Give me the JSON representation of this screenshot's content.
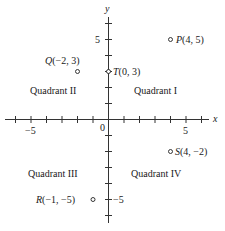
{
  "diagram": {
    "axes": {
      "x_label": "x",
      "y_label": "y",
      "origin_label": "0",
      "x_tick_labels": [
        "−5",
        "5"
      ],
      "y_tick_labels": [
        "5",
        "−5"
      ],
      "x_range": [
        -6.5,
        6.5
      ],
      "y_range": [
        -6.5,
        6.5
      ]
    },
    "quadrants": [
      {
        "label": "Quadrant I"
      },
      {
        "label": "Quadrant II"
      },
      {
        "label": "Quadrant III"
      },
      {
        "label": "Quadrant IV"
      }
    ],
    "points": [
      {
        "name": "P",
        "x": 4,
        "y": 5,
        "label_name": "P",
        "label_coords": "(4, 5)"
      },
      {
        "name": "Q",
        "x": -2,
        "y": 3,
        "label_name": "Q",
        "label_coords": "(−2, 3)"
      },
      {
        "name": "T",
        "x": 0,
        "y": 3,
        "label_name": "T",
        "label_coords": "(0, 3)"
      },
      {
        "name": "S",
        "x": 4,
        "y": -2,
        "label_name": "S",
        "label_coords": "(4, −2)"
      },
      {
        "name": "R",
        "x": -1,
        "y": -5,
        "label_name": "R",
        "label_coords": "(−1, −5)"
      }
    ]
  }
}
